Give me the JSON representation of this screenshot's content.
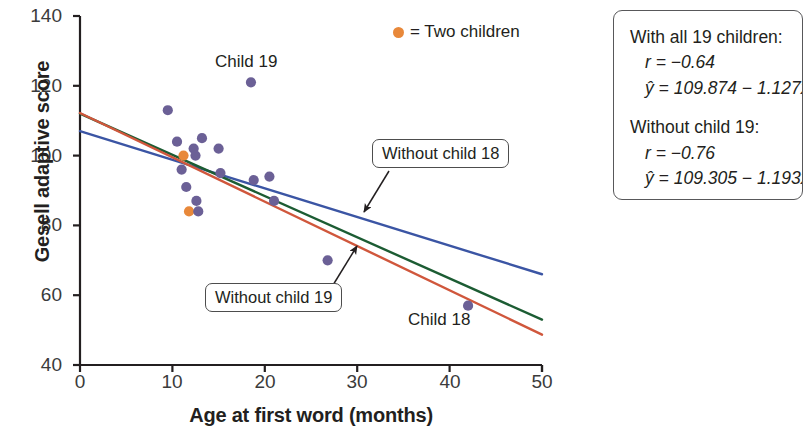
{
  "chart_data": {
    "type": "scatter",
    "title": "",
    "xlabel": "Age at first word (months)",
    "ylabel": "Gesell adaptive score",
    "xlim": [
      0,
      50
    ],
    "ylim": [
      40,
      140
    ],
    "xticks": [
      0,
      10,
      20,
      30,
      40,
      50
    ],
    "yticks": [
      40,
      60,
      80,
      100,
      120,
      140
    ],
    "grid": false,
    "legend_position": "top-right",
    "legend": [
      {
        "marker": "orange-dot",
        "label": "= Two children",
        "color": "#e8883a"
      }
    ],
    "point_colors": {
      "single_child": "#6b6096",
      "two_children": "#e8883a"
    },
    "points": [
      {
        "x": 9.5,
        "y": 113,
        "n": 1
      },
      {
        "x": 10.5,
        "y": 104,
        "n": 1
      },
      {
        "x": 11.0,
        "y": 96,
        "n": 1
      },
      {
        "x": 11.2,
        "y": 100,
        "n": 2
      },
      {
        "x": 11.5,
        "y": 91,
        "n": 1
      },
      {
        "x": 11.8,
        "y": 84,
        "n": 2
      },
      {
        "x": 12.3,
        "y": 102,
        "n": 1
      },
      {
        "x": 12.5,
        "y": 100,
        "n": 1
      },
      {
        "x": 12.6,
        "y": 87,
        "n": 1
      },
      {
        "x": 12.8,
        "y": 84,
        "n": 1
      },
      {
        "x": 13.2,
        "y": 105,
        "n": 1
      },
      {
        "x": 15.0,
        "y": 102,
        "n": 1
      },
      {
        "x": 15.2,
        "y": 95,
        "n": 1
      },
      {
        "x": 18.5,
        "y": 121,
        "n": 1
      },
      {
        "x": 18.8,
        "y": 93,
        "n": 1
      },
      {
        "x": 20.5,
        "y": 94,
        "n": 1
      },
      {
        "x": 21.0,
        "y": 87,
        "n": 1
      },
      {
        "x": 26.8,
        "y": 70,
        "n": 1
      },
      {
        "x": 42.0,
        "y": 57,
        "n": 1
      }
    ],
    "annotations": [
      {
        "id": "child-19",
        "text": "Child 19",
        "x": 18.5,
        "y": 128
      },
      {
        "id": "child-18",
        "text": "Child 18",
        "x": 40.5,
        "y": 48
      }
    ],
    "lines": [
      {
        "name": "All 19 children",
        "color": "#3b55a4",
        "intercept": 107.0,
        "slope": -0.82,
        "id": "line-all"
      },
      {
        "name": "Without child 18",
        "color": "#1c5c33",
        "intercept": 112.0,
        "slope": -1.18,
        "id": "line-without-18"
      },
      {
        "name": "Without child 19",
        "color": "#d0573c",
        "intercept": 112.2,
        "slope": -1.27,
        "id": "line-without-19"
      }
    ]
  },
  "callouts": {
    "without_child_18": "Without child 18",
    "without_child_19": "Without child 19"
  },
  "stats_box": {
    "group1": {
      "heading": "With all 19 children:",
      "r": "r = −0.64",
      "equation": "ŷ = 109.874 − 1.127x"
    },
    "group2": {
      "heading": "Without child 19:",
      "r": "r = −0.76",
      "equation": "ŷ = 109.305 − 1.193x"
    }
  },
  "axis": {
    "ytick_0": "140",
    "ytick_1": "120",
    "ytick_2": "100",
    "ytick_3": "80",
    "ytick_4": "60",
    "ytick_5": "40",
    "xtick_0": "0",
    "xtick_1": "10",
    "xtick_2": "20",
    "xtick_3": "30",
    "xtick_4": "40",
    "xtick_5": "50"
  }
}
